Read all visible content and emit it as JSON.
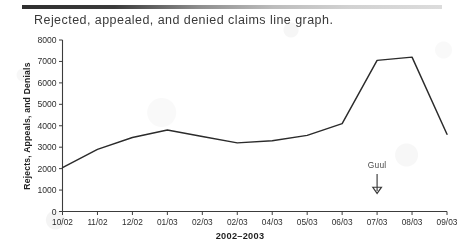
{
  "document": {
    "title": "Rejected, appealed, and denied claims line graph."
  },
  "chart_data": {
    "type": "line",
    "title": "Rejected, appealed, and denied claims line graph.",
    "xlabel": "2002–2003",
    "ylabel": "Rejects, Appeals, and Denials",
    "categories": [
      "10/02",
      "11/02",
      "12/02",
      "01/03",
      "02/03",
      "02/03",
      "04/03",
      "05/03",
      "06/03",
      "07/03",
      "08/03",
      "09/03"
    ],
    "values": [
      2050,
      2900,
      3450,
      3800,
      3500,
      3200,
      3300,
      3550,
      4100,
      7050,
      7200,
      3600
    ],
    "ylim": [
      0,
      8000
    ],
    "yticks": [
      0,
      1000,
      2000,
      3000,
      4000,
      5000,
      6000,
      7000,
      8000
    ],
    "ytick_labels": [
      "0",
      "1000",
      "2000",
      "3000",
      "4000",
      "5000",
      "6000",
      "7000",
      "8000"
    ],
    "grid": false,
    "legend": "none",
    "series": [
      {
        "name": "Rejects, Appeals, and Denials",
        "color": "#2b2b2b"
      }
    ],
    "annotations": [
      {
        "text": "Guul",
        "marker": "down-arrow",
        "near_category": "07/03"
      }
    ]
  },
  "colors": {
    "line": "#2b2b2b",
    "axis": "#3c3c3c",
    "text": "#2e2e2e",
    "rule_dark": "#2f2f2f",
    "rule_light": "#dcdcdc",
    "page_background": "#ffffff"
  }
}
